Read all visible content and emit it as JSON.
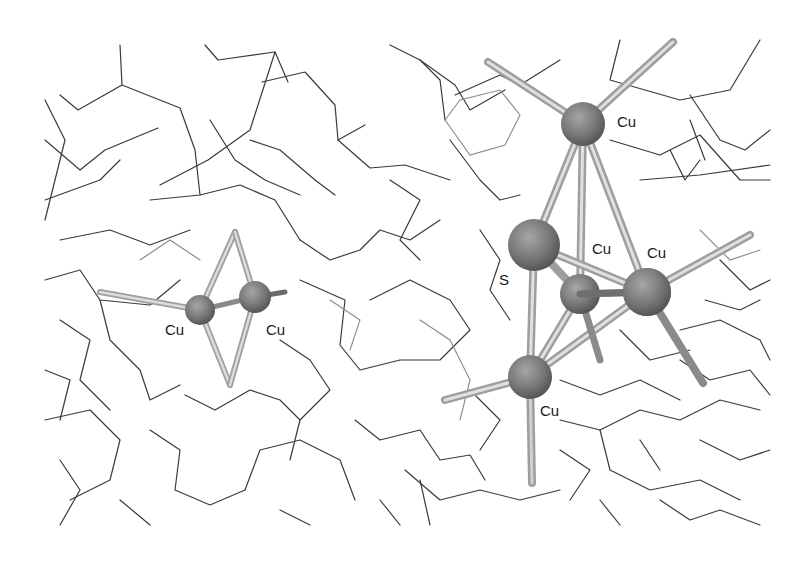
{
  "figure": {
    "colors": {
      "background": "#ffffff",
      "wireframe": "#3a3a3a",
      "atom_fill": "#7d7d7d",
      "bond": "#b9b9b9"
    }
  },
  "labels": {
    "cu_dinuclear_left": "Cu",
    "cu_dinuclear_right": "Cu",
    "cu_cluster_top": "Cu",
    "cu_cluster_middle": "Cu",
    "cu_cluster_right": "Cu",
    "cu_cluster_bottom": "Cu",
    "sulfur": "S"
  },
  "atoms": [
    {
      "id": "cuA1",
      "element": "Cu",
      "x": 200,
      "y": 310,
      "r": 15
    },
    {
      "id": "cuA2",
      "element": "Cu",
      "x": 255,
      "y": 297,
      "r": 16
    },
    {
      "id": "cuZ_top",
      "element": "Cu",
      "x": 583,
      "y": 124,
      "r": 22
    },
    {
      "id": "s",
      "element": "S",
      "x": 534,
      "y": 245,
      "r": 26
    },
    {
      "id": "cuZ_mid",
      "element": "Cu",
      "x": 580,
      "y": 294,
      "r": 20
    },
    {
      "id": "cuZ_right",
      "element": "Cu",
      "x": 647,
      "y": 292,
      "r": 24
    },
    {
      "id": "cuZ_bottom",
      "element": "Cu",
      "x": 530,
      "y": 377,
      "r": 22
    }
  ]
}
